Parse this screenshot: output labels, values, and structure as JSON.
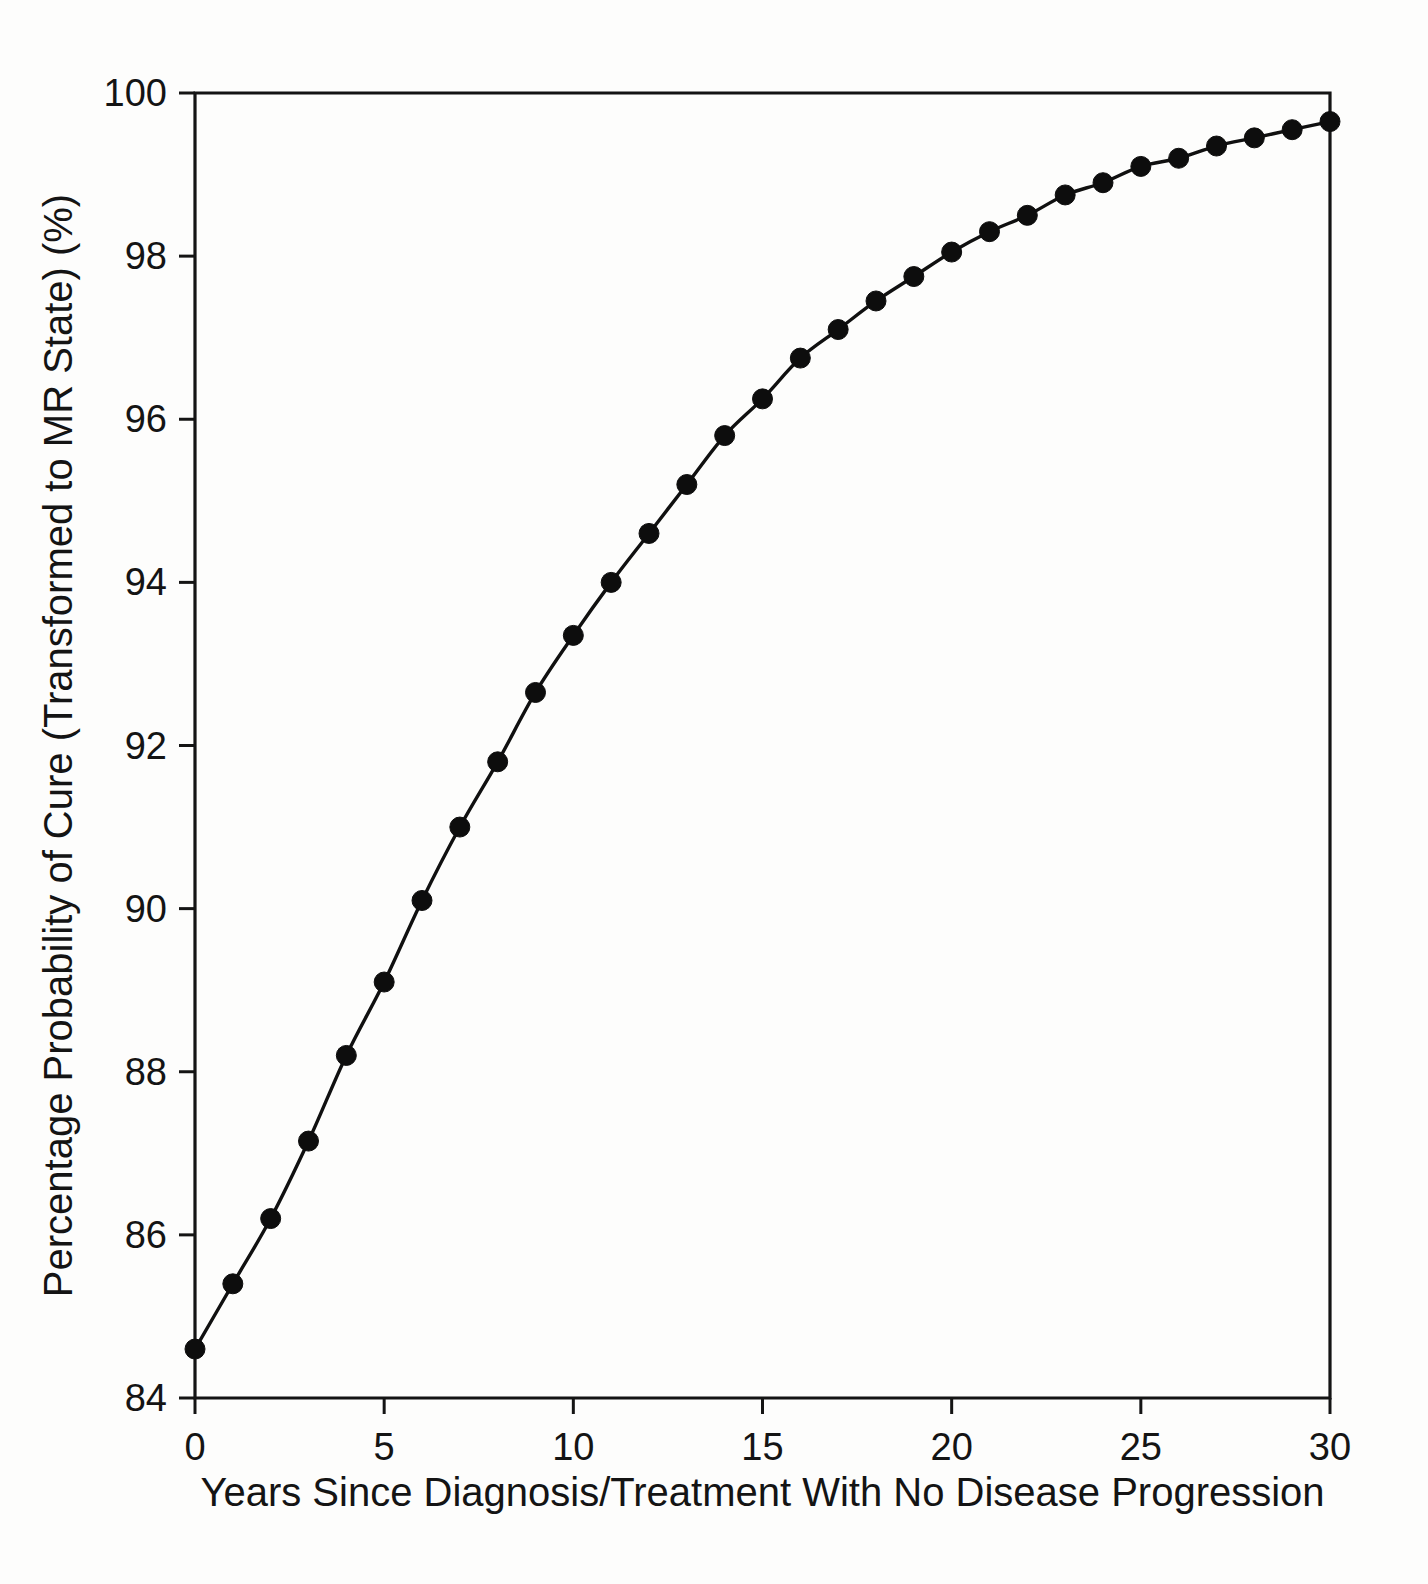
{
  "figure": {
    "background_color": "#fdfdfc",
    "foreground_color": "#141414"
  },
  "chart_data": {
    "type": "line",
    "title": "",
    "subtitle": "",
    "xlabel": "Years Since Diagnosis/Treatment With No Disease Progression",
    "ylabel": "Percentage Probability of Cure (Transformed to MR State) (%)",
    "xlim": [
      0,
      30
    ],
    "ylim": [
      84,
      100
    ],
    "xticks": [
      0,
      5,
      10,
      15,
      20,
      25,
      30
    ],
    "xtick_labels": [
      "0",
      "5",
      "10",
      "15",
      "20",
      "25",
      "30"
    ],
    "yticks": [
      84,
      86,
      88,
      90,
      92,
      94,
      96,
      98,
      100
    ],
    "ytick_labels": [
      "84",
      "86",
      "88",
      "90",
      "92",
      "94",
      "96",
      "98",
      "100"
    ],
    "grid": false,
    "legend": false,
    "legend_position": "none",
    "marker": "filled-circle",
    "marker_color": "#0d0d0d",
    "line_color": "#101010",
    "x": [
      0,
      1,
      2,
      3,
      4,
      5,
      6,
      7,
      8,
      9,
      10,
      11,
      12,
      13,
      14,
      15,
      16,
      17,
      18,
      19,
      20,
      21,
      22,
      23,
      24,
      25,
      26,
      27,
      28,
      29,
      30
    ],
    "values": [
      84.6,
      85.4,
      86.2,
      87.15,
      88.2,
      89.1,
      90.1,
      91.0,
      91.8,
      92.65,
      93.35,
      94.0,
      94.6,
      95.2,
      95.8,
      96.25,
      96.75,
      97.1,
      97.45,
      97.75,
      98.05,
      98.3,
      98.5,
      98.75,
      98.9,
      99.1,
      99.2,
      99.35,
      99.45,
      99.55,
      99.65
    ],
    "series": [
      {
        "name": "Probability of cure",
        "values": [
          84.6,
          85.4,
          86.2,
          87.15,
          88.2,
          89.1,
          90.1,
          91.0,
          91.8,
          92.65,
          93.35,
          94.0,
          94.6,
          95.2,
          95.8,
          96.25,
          96.75,
          97.1,
          97.45,
          97.75,
          98.05,
          98.3,
          98.5,
          98.75,
          98.9,
          99.1,
          99.2,
          99.35,
          99.45,
          99.55,
          99.65
        ]
      }
    ]
  }
}
